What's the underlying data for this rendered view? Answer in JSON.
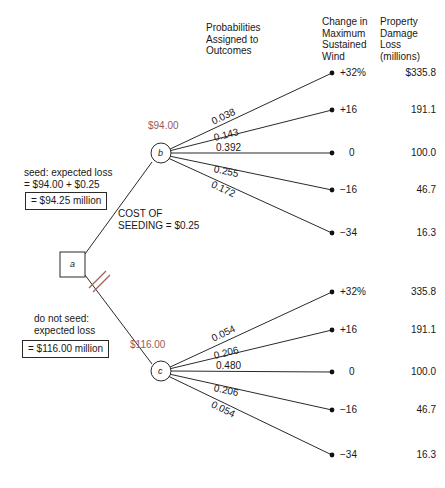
{
  "diagram": {
    "title_headers": {
      "probabilities": "Probabilities\nAssigned to\nOutcomes",
      "wind": "Change in\nMaximum\nSustained\nWind",
      "loss": "Property\nDamage\nLoss\n(millions)"
    },
    "decision_node": {
      "label": "a",
      "shape": "square"
    },
    "branches": [
      {
        "name": "seed",
        "chance_node_label": "b",
        "chance_node_value": "$94.00",
        "side_text": "seed: expected loss\n= $94.00 + $0.25",
        "boxed_result": "= $94.25 million",
        "cost_note": "COST OF\nSEEDING  =  $0.25",
        "outcomes": [
          {
            "probability": "0.038",
            "wind": "+32%",
            "loss": "$335.8"
          },
          {
            "probability": "0.143",
            "wind": "+16",
            "loss": "191.1"
          },
          {
            "probability": "0.392",
            "wind": "0",
            "loss": "100.0"
          },
          {
            "probability": "0.255",
            "wind": "−16",
            "loss": "46.7"
          },
          {
            "probability": "0.172",
            "wind": "−34",
            "loss": "16.3"
          }
        ]
      },
      {
        "name": "do-not-seed",
        "chance_node_label": "c",
        "chance_node_value": "$116.00",
        "side_text": "do not seed:\nexpected loss",
        "boxed_result": "= $116.00 million",
        "outcomes": [
          {
            "probability": "0.054",
            "wind": "+32%",
            "loss": "335.8"
          },
          {
            "probability": "0.206",
            "wind": "+16",
            "loss": "191.1"
          },
          {
            "probability": "0.480",
            "wind": "0",
            "loss": "100.0"
          },
          {
            "probability": "0.206",
            "wind": "−16",
            "loss": "46.7"
          },
          {
            "probability": "0.054",
            "wind": "−34",
            "loss": "16.3"
          }
        ]
      }
    ],
    "colors": {
      "line": "#2a2a2a",
      "value_label": "#9b5a55",
      "pruned_mark": "#a2625c",
      "text": "#181818"
    }
  }
}
